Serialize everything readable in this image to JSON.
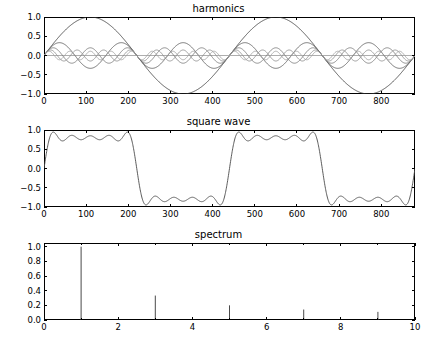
{
  "figure": {
    "background": "#ffffff",
    "line_color": "#000000",
    "axis_color": "#000000"
  },
  "chart_data": [
    {
      "type": "line",
      "title": "harmonics",
      "xlabel": "",
      "ylabel": "",
      "xlim": [
        0,
        880
      ],
      "ylim": [
        -1.0,
        1.0
      ],
      "xticks": [
        0,
        100,
        200,
        300,
        400,
        500,
        600,
        700,
        800
      ],
      "yticks": [
        -1.0,
        -0.5,
        0.0,
        0.5,
        1.0
      ],
      "xticklabels": [
        "0",
        "100",
        "200",
        "300",
        "400",
        "500",
        "600",
        "700",
        "800"
      ],
      "yticklabels": [
        "-1.0",
        "-0.5",
        "0.0",
        "0.5",
        "1.0"
      ],
      "grid": false,
      "legend": "none",
      "description": "Odd harmonic sine components of a square wave Fourier series, period 440 samples",
      "period": 440,
      "series": [
        {
          "name": "harmonic 1",
          "harmonic": 1,
          "amplitude": 1.0,
          "color": "#3b3b3b"
        },
        {
          "name": "harmonic 3",
          "harmonic": 3,
          "amplitude": 0.3333,
          "color": "#5a5a5a"
        },
        {
          "name": "harmonic 5",
          "harmonic": 5,
          "amplitude": 0.2,
          "color": "#777777"
        },
        {
          "name": "harmonic 7",
          "harmonic": 7,
          "amplitude": 0.1429,
          "color": "#8c8c8c"
        },
        {
          "name": "harmonic 9",
          "harmonic": 9,
          "amplitude": 0.1111,
          "color": "#a0a0a0"
        }
      ]
    },
    {
      "type": "line",
      "title": "square wave",
      "xlabel": "",
      "ylabel": "",
      "xlim": [
        0,
        880
      ],
      "ylim": [
        -1.0,
        1.0
      ],
      "xticks": [
        0,
        100,
        200,
        300,
        400,
        500,
        600,
        700,
        800
      ],
      "yticks": [
        -1.0,
        -0.5,
        0.0,
        0.5,
        1.0
      ],
      "xticklabels": [
        "0",
        "100",
        "200",
        "300",
        "400",
        "500",
        "600",
        "700",
        "800"
      ],
      "yticklabels": [
        "-1.0",
        "-0.5",
        "0.0",
        "0.5",
        "1.0"
      ],
      "grid": false,
      "legend": "none",
      "description": "Sum of the five odd harmonics giving an approximate square wave with Gibbs ringing",
      "period": 440,
      "peak_amplitude": 0.93,
      "series": [
        {
          "name": "square wave sum",
          "harmonics": [
            1,
            3,
            5,
            7,
            9
          ],
          "color": "#4a4a4a"
        }
      ]
    },
    {
      "type": "bar",
      "title": "spectrum",
      "xlabel": "",
      "ylabel": "",
      "xlim": [
        0,
        10
      ],
      "ylim": [
        0.0,
        1.05
      ],
      "xticks": [
        0,
        2,
        4,
        6,
        8,
        10
      ],
      "yticks": [
        0.0,
        0.2,
        0.4,
        0.6,
        0.8,
        1.0
      ],
      "xticklabels": [
        "0",
        "2",
        "4",
        "6",
        "8",
        "10"
      ],
      "yticklabels": [
        "0.0",
        "0.2",
        "0.4",
        "0.6",
        "0.8",
        "1.0"
      ],
      "minor_xticks": [
        1,
        3,
        5,
        7,
        9
      ],
      "grid": false,
      "legend": "none",
      "description": "Amplitude spectrum: odd harmonics only, amplitudes falling as 1/n",
      "categories": [
        1,
        3,
        5,
        7,
        9
      ],
      "values": [
        1.0,
        0.3333,
        0.2,
        0.1429,
        0.1111
      ],
      "bar_color": "#4a4a4a"
    }
  ]
}
